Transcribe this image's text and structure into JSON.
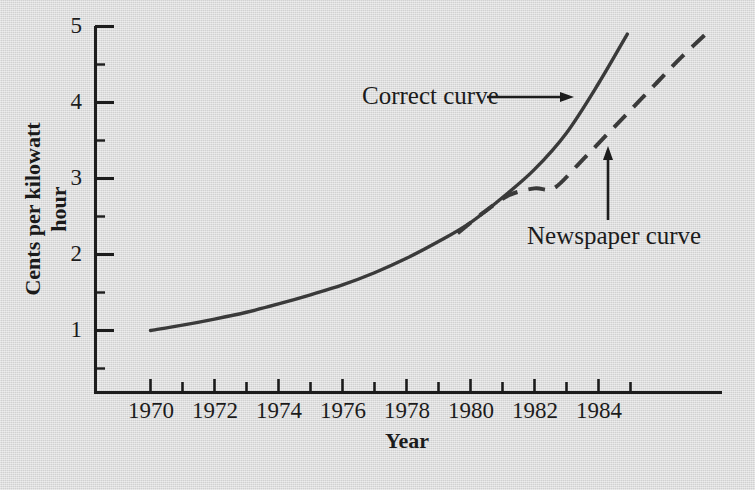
{
  "chart_data": {
    "type": "line",
    "title": "",
    "xlabel": "Year",
    "ylabel": "Cents per kilowatt hour",
    "xlim": [
      1968.4,
      1987.6
    ],
    "ylim": [
      0.36,
      5.0
    ],
    "grid": false,
    "legend_position": "inline-annotations",
    "x_ticks": [
      1970,
      1971,
      1972,
      1973,
      1974,
      1975,
      1976,
      1977,
      1978,
      1979,
      1980,
      1981,
      1982,
      1983,
      1984,
      1985
    ],
    "x_tick_labels": [
      "1970",
      "",
      "1972",
      "",
      "1974",
      "",
      "1976",
      "",
      "1978",
      "",
      "1980",
      "",
      "1982",
      "",
      "1984",
      ""
    ],
    "x_labeled_ticks": [
      {
        "year": 1970,
        "label": "1970"
      },
      {
        "year": 1972,
        "label": "1972"
      },
      {
        "year": 1974,
        "label": "1974"
      },
      {
        "year": 1976,
        "label": "1976"
      },
      {
        "year": 1978,
        "label": "1978"
      },
      {
        "year": 1980,
        "label": "1980"
      },
      {
        "year": 1982,
        "label": "1982"
      },
      {
        "year": 1984,
        "label": "1984"
      }
    ],
    "y_ticks": [
      1,
      2,
      3,
      4,
      5
    ],
    "y_tick_labels": [
      "1",
      "2",
      "3",
      "4",
      "5"
    ],
    "y_minor_ticks": [
      0.5,
      1.5,
      2.5,
      3.5,
      4.5
    ],
    "series": [
      {
        "name": "Correct curve",
        "style": "solid",
        "color": "#3a3a3a",
        "x": [
          1970,
          1971,
          1972,
          1973,
          1974,
          1975,
          1976,
          1977,
          1978,
          1979,
          1980,
          1981,
          1982,
          1983,
          1984,
          1984.9
        ],
        "values": [
          1.0,
          1.07,
          1.15,
          1.24,
          1.35,
          1.47,
          1.6,
          1.76,
          1.95,
          2.17,
          2.42,
          2.75,
          3.12,
          3.6,
          4.25,
          4.9
        ]
      },
      {
        "name": "Newspaper curve",
        "style": "dashed",
        "color": "#3a3a3a",
        "x": [
          1979.6,
          1980.4,
          1981.2,
          1982.0,
          1982.6,
          1983.4,
          1984.2,
          1985.0,
          1985.8,
          1986.6,
          1987.5
        ],
        "values": [
          2.28,
          2.55,
          2.78,
          2.87,
          2.87,
          3.2,
          3.55,
          3.9,
          4.25,
          4.6,
          4.96
        ]
      }
    ],
    "annotations": [
      {
        "text": "Correct curve",
        "kind": "label-with-arrow",
        "arrow": "horizontal-right",
        "points_to_series": "Correct curve"
      },
      {
        "text": "Newspaper curve",
        "kind": "label-with-arrow",
        "arrow": "vertical-up",
        "points_to_series": "Newspaper curve"
      }
    ],
    "colors": {
      "background": "#d9d9d9",
      "axis": "#1c1c1c",
      "curve": "#3a3a3a",
      "text": "#1c1c1c"
    }
  }
}
